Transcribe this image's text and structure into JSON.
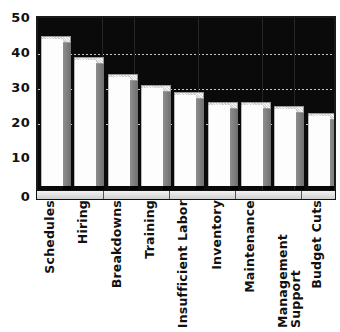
{
  "chart_data": {
    "type": "bar",
    "title": "",
    "subtitle": "",
    "xlabel": "",
    "ylabel": "",
    "ylim": [
      0,
      50
    ],
    "yticks": [
      0,
      10,
      20,
      30,
      40,
      50
    ],
    "ytick_labels": [
      "0",
      "10",
      "20",
      "30",
      "40",
      "50"
    ],
    "grid": true,
    "gridlines_at": [
      20,
      30,
      40
    ],
    "legend": null,
    "legend_position": "none",
    "orientation": "vertical",
    "style": "3d-white-bars-on-black-plot",
    "categories": [
      "Schedules",
      "Hiring",
      "Breakdowns",
      "Training",
      "Insufficient Labor",
      "Inventory",
      "Maintenance",
      "Management Support",
      "Budget Cuts"
    ],
    "category_lines": [
      [
        "Schedules"
      ],
      [
        "Hiring"
      ],
      [
        "Breakdowns"
      ],
      [
        "Training"
      ],
      [
        "Insufficient Labor"
      ],
      [
        "Inventory"
      ],
      [
        "Maintenance"
      ],
      [
        "Management",
        "Support"
      ],
      [
        "Budget Cuts"
      ]
    ],
    "values": [
      42,
      36,
      31,
      28,
      26,
      23,
      23,
      22,
      20
    ],
    "series": [
      {
        "name": "",
        "values": [
          42,
          36,
          31,
          28,
          26,
          23,
          23,
          22,
          20
        ]
      }
    ],
    "colors": {
      "bar_face": "#fdfdfd",
      "bar_side": "#7f7f7f",
      "bar_top": "#dcdcdc",
      "plot_background": "#0a0a0a",
      "gridline": "#e8e8e8",
      "text": "#111111",
      "page_background": "#ffffff"
    }
  }
}
